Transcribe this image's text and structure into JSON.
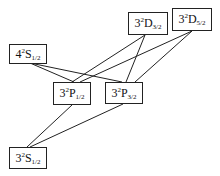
{
  "diagram": {
    "levels": [
      {
        "id": "4S12",
        "n": "4",
        "mult": "2",
        "L": "S",
        "J": "1/2",
        "box": [
          9,
          44,
          38,
          20
        ]
      },
      {
        "id": "3D32",
        "n": "3",
        "mult": "2",
        "L": "D",
        "J": "3/2",
        "box": [
          128,
          12,
          40,
          23
        ]
      },
      {
        "id": "3D52",
        "n": "3",
        "mult": "2",
        "L": "D",
        "J": "5/2",
        "box": [
          172,
          8,
          40,
          23
        ]
      },
      {
        "id": "3P12",
        "n": "3",
        "mult": "2",
        "L": "P",
        "J": "1/2",
        "box": [
          53,
          82,
          38,
          23
        ]
      },
      {
        "id": "3P32",
        "n": "3",
        "mult": "2",
        "L": "P",
        "J": "3/2",
        "box": [
          105,
          82,
          38,
          22
        ]
      },
      {
        "id": "3S12",
        "n": "3",
        "mult": "2",
        "L": "S",
        "J": "1/2",
        "box": [
          9,
          147,
          38,
          22
        ]
      }
    ],
    "transitions": [
      {
        "from": "4S12",
        "to": "3P12",
        "line": [
          30,
          63,
          74,
          82
        ]
      },
      {
        "from": "4S12",
        "to": "3P32",
        "line": [
          30,
          63,
          122,
          82
        ]
      },
      {
        "from": "3D32",
        "to": "3P12",
        "line": [
          145,
          35,
          72,
          82
        ]
      },
      {
        "from": "3D32",
        "to": "3P32",
        "line": [
          145,
          35,
          126,
          82
        ]
      },
      {
        "from": "3D52",
        "to": "3P12",
        "line": [
          192,
          31,
          80,
          82
        ]
      },
      {
        "from": "3D52",
        "to": "3P32",
        "line": [
          192,
          31,
          135,
          82
        ]
      },
      {
        "from": "3P12",
        "to": "3S12",
        "line": [
          72,
          105,
          27,
          147
        ]
      },
      {
        "from": "3P32",
        "to": "3S12",
        "line": [
          123,
          104,
          30,
          147
        ]
      }
    ],
    "line_color": "#222222"
  }
}
